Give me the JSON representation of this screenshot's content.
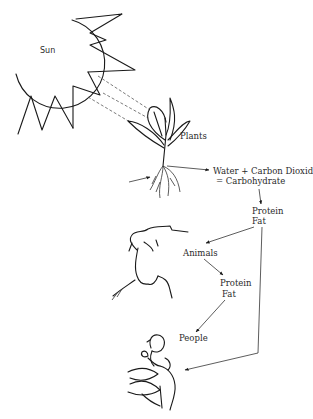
{
  "diagram": {
    "type": "food-chain / energy-flow illustration",
    "nodes": [
      {
        "id": "sun",
        "label": "Sun"
      },
      {
        "id": "plants",
        "label": "Plants"
      },
      {
        "id": "photosynthesis",
        "label_line1": "Water + Carbon Dioxide",
        "label_line2": "= Carbohydrate"
      },
      {
        "id": "plant_nutrients",
        "label_line1": "Protein",
        "label_line2": "Fat"
      },
      {
        "id": "animals",
        "label": "Animals"
      },
      {
        "id": "animal_nutrients",
        "label_line1": "Protein",
        "label_line2": "Fat"
      },
      {
        "id": "people",
        "label": "People"
      }
    ],
    "edges": [
      {
        "from": "sun",
        "to": "plants",
        "style": "dashed rays"
      },
      {
        "from": "soil",
        "to": "plants",
        "style": "arrow into roots"
      },
      {
        "from": "plants",
        "to": "photosynthesis",
        "style": "arrow"
      },
      {
        "from": "photosynthesis",
        "to": "plant_nutrients",
        "style": "arrow"
      },
      {
        "from": "plant_nutrients",
        "to": "animals",
        "style": "arrow"
      },
      {
        "from": "plant_nutrients",
        "to": "people",
        "style": "arrow"
      },
      {
        "from": "animals",
        "to": "animal_nutrients",
        "style": "arrow"
      },
      {
        "from": "animal_nutrients",
        "to": "people",
        "style": "arrow"
      }
    ],
    "illustrations": [
      "sun-drawing",
      "plant-drawing",
      "cow-drawing",
      "mother-and-child-drawing"
    ]
  },
  "labels": {
    "sun": "Sun",
    "plants": "Plants",
    "water_co2": "Water + Carbon Dioxide",
    "carbohydrate": "= Carbohydrate",
    "protein1": "Protein",
    "fat1": "Fat",
    "animals": "Animals",
    "protein2": "Protein",
    "fat2": "Fat",
    "people": "People"
  },
  "colors": {
    "ink": "#1a1a1a",
    "background": "#ffffff"
  }
}
